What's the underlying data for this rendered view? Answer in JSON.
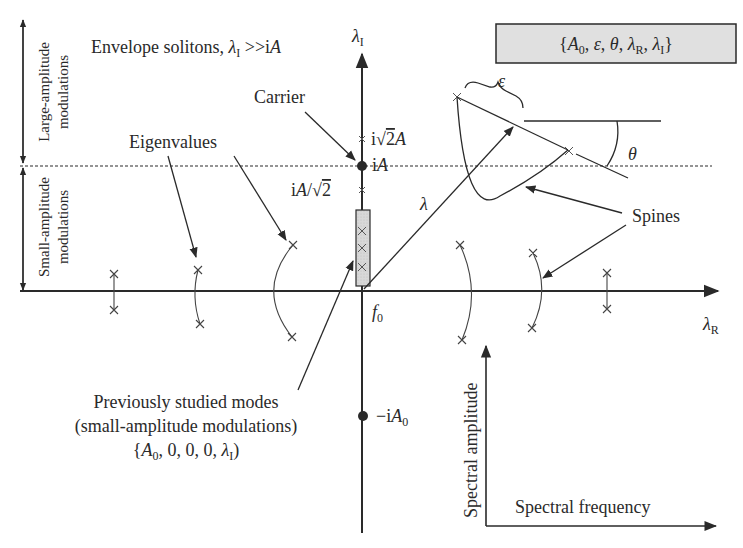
{
  "diagram": {
    "parameter_box": {
      "open": "{",
      "A": "A",
      "A_sub": "0",
      "sep1": ", ",
      "eps": "ε",
      "sep2": ", ",
      "theta": "θ",
      "sep3": ", ",
      "lamR": "λ",
      "lamR_sub": "R",
      "sep4": ", ",
      "lamI": "λ",
      "lamI_sub": "I",
      "close": "}",
      "fill_color": "#e0e0e0"
    },
    "regions": {
      "large": {
        "line1": "Large-amplitude",
        "line2": "modulations"
      },
      "small": {
        "line1": "Small-amplitude",
        "line2": "modulations"
      }
    },
    "envelope": {
      "text": "Envelope solitons, ",
      "lam": "λ",
      "lam_sub": "I",
      "rel": " >>i",
      "A": "A"
    },
    "axes": {
      "imag": {
        "sym": "λ",
        "sub": "I"
      },
      "real": {
        "sym": "λ",
        "sub": "R"
      },
      "origin": {
        "sym": "f",
        "sub": "0"
      }
    },
    "markers": {
      "sqrt2A": {
        "prefix": "i",
        "root": "√",
        "two": "2",
        "A": "A"
      },
      "iA": {
        "prefix": "i",
        "A": "A"
      },
      "A_over_sqrt2": {
        "prefix": "i",
        "A": "A",
        "slash": "/",
        "root": "√",
        "two": "2"
      },
      "neg_iA0": {
        "prefix": "−i",
        "A": "A",
        "sub": "0"
      }
    },
    "labels": {
      "carrier": "Carrier",
      "eigenvalues": "Eigenvalues",
      "spines": "Spines",
      "lambda": "λ",
      "epsilon": "ε",
      "theta": "θ"
    },
    "previous_modes": {
      "line1": "Previously studied modes",
      "line2": "(small-amplitude modulations)",
      "line3_open": "{",
      "line3_A": "A",
      "line3_A_sub": "0",
      "line3_mid": ", 0, 0, 0, ",
      "line3_lam": "λ",
      "line3_lam_sub": "I",
      "line3_close": ")"
    },
    "inset": {
      "ylabel": "Spectral amplitude",
      "xlabel": "Spectral frequency"
    },
    "colors": {
      "ink": "#2a2a2a",
      "box_fill": "#e0e0e0",
      "bar_fill": "#d8d8d8"
    }
  }
}
